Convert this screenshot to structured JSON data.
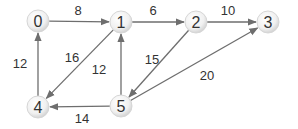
{
  "diagram": {
    "type": "directed-weighted-graph",
    "colors": {
      "background": "#ffffff",
      "edge": "#6e6e6e",
      "node_fill_center": "#ffffff",
      "node_fill_edge": "#d9d9d9",
      "text": "#333333"
    },
    "nodes": [
      {
        "id": "0",
        "label": "0",
        "x": 38,
        "y": 21
      },
      {
        "id": "1",
        "label": "1",
        "x": 121,
        "y": 22
      },
      {
        "id": "2",
        "label": "2",
        "x": 196,
        "y": 22
      },
      {
        "id": "3",
        "label": "3",
        "x": 268,
        "y": 22
      },
      {
        "id": "4",
        "label": "4",
        "x": 38,
        "y": 107
      },
      {
        "id": "5",
        "label": "5",
        "x": 121,
        "y": 106
      }
    ],
    "edges": [
      {
        "from": "0",
        "to": "1",
        "weight": "8",
        "label_x": 78,
        "label_y": 15
      },
      {
        "from": "1",
        "to": "2",
        "weight": "6",
        "label_x": 153,
        "label_y": 15
      },
      {
        "from": "2",
        "to": "3",
        "weight": "10",
        "label_x": 228,
        "label_y": 15
      },
      {
        "from": "4",
        "to": "0",
        "weight": "12",
        "label_x": 20,
        "label_y": 68
      },
      {
        "from": "1",
        "to": "4",
        "weight": "16",
        "label_x": 72,
        "label_y": 62
      },
      {
        "from": "5",
        "to": "1",
        "weight": "12",
        "label_x": 99,
        "label_y": 74
      },
      {
        "from": "2",
        "to": "5",
        "weight": "15",
        "label_x": 152,
        "label_y": 64
      },
      {
        "from": "5",
        "to": "3",
        "weight": "20",
        "label_x": 207,
        "label_y": 80
      },
      {
        "from": "5",
        "to": "4",
        "weight": "14",
        "label_x": 82,
        "label_y": 123
      }
    ]
  }
}
